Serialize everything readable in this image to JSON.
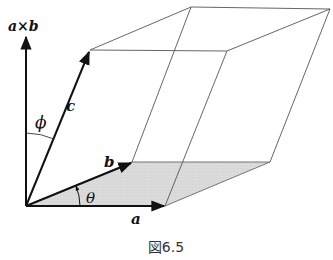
{
  "figure": {
    "caption": "図6.5",
    "labels": {
      "cross_product": "a×b",
      "vec_a": "a",
      "vec_b": "b",
      "vec_c": "c",
      "angle_phi": "ϕ",
      "angle_theta": "θ"
    },
    "colors": {
      "line": "#555555",
      "vector": "#111111",
      "shade": "#dcdcdc"
    },
    "vertices": {
      "O": [
        26,
        206
      ],
      "a": [
        165,
        206
      ],
      "b": [
        132,
        162
      ],
      "a_plus_b": [
        270,
        162
      ],
      "c": [
        90,
        50
      ],
      "c_plus_a": [
        227,
        51
      ],
      "c_plus_b": [
        191,
        7
      ],
      "c_plus_a_plus_b": [
        330,
        9
      ],
      "a_cross_b_tip": [
        26,
        36
      ]
    }
  }
}
